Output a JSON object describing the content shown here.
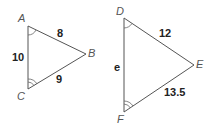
{
  "figure": {
    "triangles": [
      {
        "name": "ABC",
        "vertices": {
          "A": "A",
          "B": "B",
          "C": "C"
        },
        "sides": {
          "AB": "8",
          "AC": "10",
          "CB": "9"
        },
        "angle_marks": {
          "A": "single arc",
          "C": "double arc"
        }
      },
      {
        "name": "DEF",
        "vertices": {
          "D": "D",
          "E": "E",
          "F": "F"
        },
        "sides": {
          "DE": "12",
          "DF": "e",
          "FE": "13.5"
        },
        "angle_marks": {
          "D": "single arc",
          "F": "double arc"
        }
      }
    ]
  },
  "labels": {
    "A": "A",
    "B": "B",
    "C": "C",
    "D": "D",
    "E": "E",
    "F": "F",
    "AB": "8",
    "AC": "10",
    "CB": "9",
    "DE": "12",
    "DF": "e",
    "FE": "13.5"
  }
}
